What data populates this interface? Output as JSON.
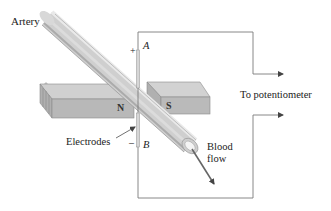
{
  "figure": {
    "labels": {
      "artery": "Artery",
      "electrodes": "Electrodes",
      "potentiometer": "To potentiometer",
      "blood_flow_line1": "Blood",
      "blood_flow_line2": "flow",
      "point_a": "A",
      "point_b": "B",
      "plus_sign": "+",
      "minus_sign": "–",
      "north_pole": "N",
      "south_pole": "S"
    },
    "colors": {
      "wire": "#7a7a7a",
      "arrow": "#555555",
      "magnet_top": "#cfcfcf",
      "magnet_front": "#b4b4b4",
      "artery_light": "#e6e6e6",
      "artery_dark": "#a9a9a9",
      "background": "#ffffff"
    }
  }
}
